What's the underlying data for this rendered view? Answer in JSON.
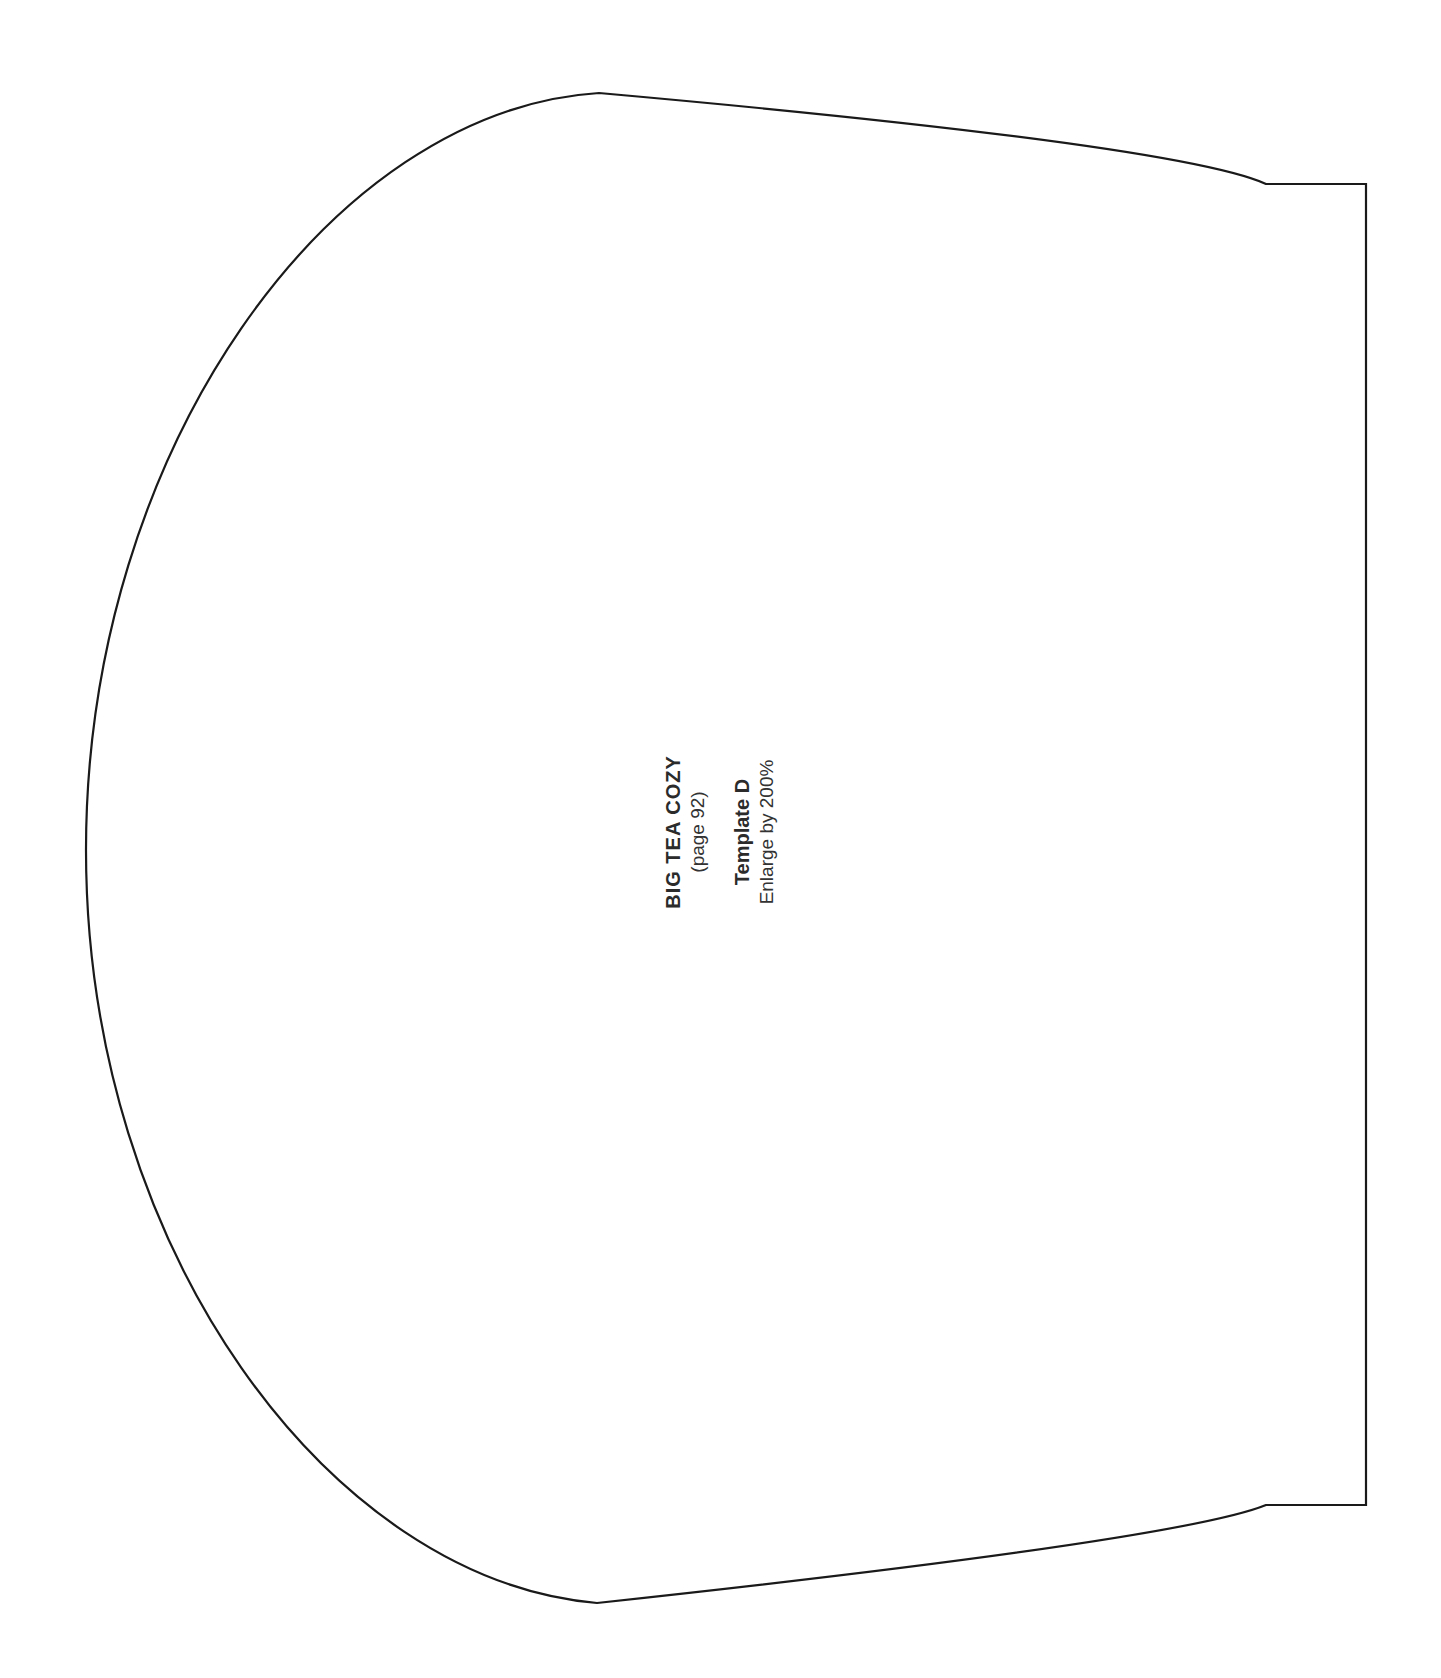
{
  "document": {
    "title": "BIG TEA COZY",
    "page_reference": "(page 92)",
    "template_name": "Template D",
    "instruction": "Enlarge by 200%"
  },
  "outline": {
    "shape": "tea-cozy-pattern",
    "stroke_color": "#1a1a1a",
    "fill_color": "#ffffff"
  }
}
